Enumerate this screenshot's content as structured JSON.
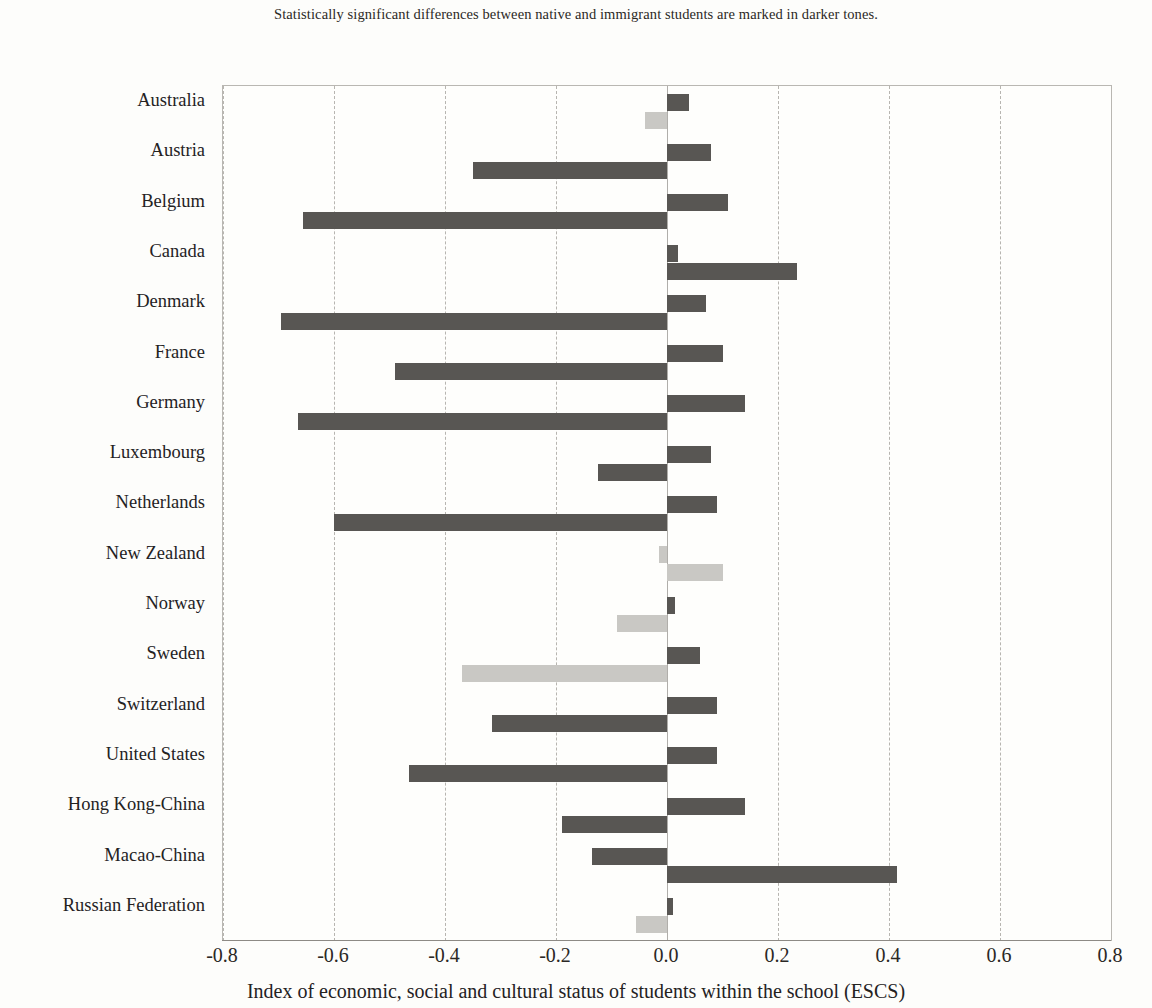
{
  "note": "Statistically significant differences between native and immigrant students are marked in darker tones.",
  "axis": {
    "x_title": "Index of economic, social and cultural status of students within the school (ESCS)",
    "ticks": [
      "-0.8",
      "-0.6",
      "-0.4",
      "-0.2",
      "0.0",
      "0.2",
      "0.4",
      "0.6",
      "0.8"
    ]
  },
  "colors": {
    "significant": "#585653",
    "not_significant": "#c9c8c4",
    "grid": "#b7b5b0",
    "text": "#24221f"
  },
  "chart_data": {
    "type": "bar",
    "title": "",
    "subtitle": "Statistically significant differences between native and immigrant students are marked in darker tones.",
    "orientation": "horizontal",
    "xlabel": "Index of economic, social and cultural status of students within the school (ESCS)",
    "ylabel": "",
    "xlim": [
      -0.8,
      0.8
    ],
    "xticks": [
      -0.8,
      -0.6,
      -0.4,
      -0.2,
      0.0,
      0.2,
      0.4,
      0.6,
      0.8
    ],
    "grid": true,
    "legend": "none",
    "categories": [
      "Australia",
      "Austria",
      "Belgium",
      "Canada",
      "Denmark",
      "France",
      "Germany",
      "Luxembourg",
      "Netherlands",
      "New Zealand",
      "Norway",
      "Sweden",
      "Switzerland",
      "United States",
      "Hong Kong-China",
      "Macao-China",
      "Russian Federation"
    ],
    "series": [
      {
        "name": "Native students",
        "values": [
          0.04,
          0.08,
          0.11,
          0.02,
          0.07,
          0.1,
          0.14,
          0.08,
          0.09,
          -0.015,
          0.015,
          0.06,
          0.09,
          0.09,
          0.14,
          -0.135,
          0.01
        ],
        "significant": [
          true,
          true,
          true,
          true,
          true,
          true,
          true,
          true,
          true,
          false,
          true,
          true,
          true,
          true,
          true,
          true,
          true
        ]
      },
      {
        "name": "Immigrant students",
        "values": [
          -0.04,
          -0.35,
          -0.655,
          0.235,
          -0.695,
          -0.49,
          -0.665,
          -0.125,
          -0.6,
          0.1,
          -0.09,
          -0.37,
          -0.315,
          -0.465,
          -0.19,
          0.415,
          -0.055
        ],
        "significant": [
          false,
          true,
          true,
          true,
          true,
          true,
          true,
          true,
          true,
          false,
          false,
          false,
          true,
          true,
          true,
          true,
          false
        ]
      }
    ]
  }
}
